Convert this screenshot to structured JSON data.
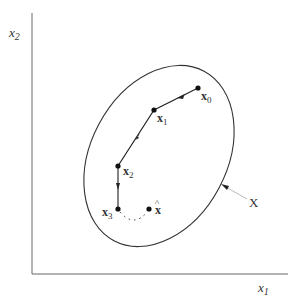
{
  "diagram": {
    "axes": {
      "x_label": "x",
      "x_label_sub": "1",
      "y_label": "x",
      "y_label_sub": "2"
    },
    "set_label": "X",
    "points": [
      {
        "name": "x",
        "sub": "0"
      },
      {
        "name": "x",
        "sub": "1"
      },
      {
        "name": "x",
        "sub": "2"
      },
      {
        "name": "x",
        "sub": "3"
      },
      {
        "name": "x̂",
        "sub": ""
      }
    ],
    "hat_symbol": "^",
    "colors": {
      "stroke": "#333333",
      "axis": "#555555",
      "pointer": "#bbbbbb"
    }
  }
}
